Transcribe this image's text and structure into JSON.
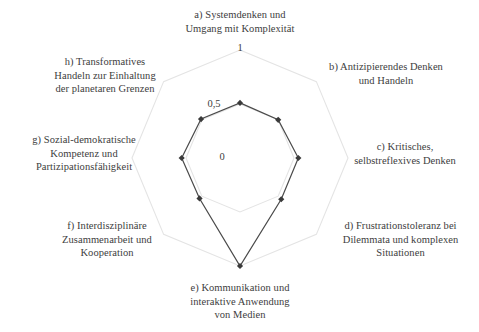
{
  "chart_data": {
    "type": "radar",
    "title": "",
    "categories": [
      "a) Systemdenken und Umgang mit Komplexität",
      "b) Antizipierendes Denken und Handeln",
      "c) Kritisches, selbstreflexives Denken",
      "d) Frustrationstoleranz bei Dilemmata und komplexen Situationen",
      "e) Kommunikation und interaktive Anwendung von Medien",
      "f) Interdisziplinäre Zusammenarbeit und Kooperation",
      "g) Sozial-demokratische Kompetenz und Partizipationsfähigkeit",
      "h) Transformatives Handeln zur Einhaltung der planetaren Grenzen"
    ],
    "short_labels": [
      "a",
      "b",
      "c",
      "d",
      "e",
      "f",
      "g",
      "h"
    ],
    "values": [
      0.51,
      0.5,
      0.54,
      0.54,
      1.0,
      0.53,
      0.54,
      0.51
    ],
    "rlim": [
      0,
      1
    ],
    "tick_values": [
      0,
      0.5,
      1
    ],
    "tick_labels": [
      "0",
      "0,5",
      "1"
    ],
    "grid": true,
    "legend": "none",
    "series": [
      {
        "name": "",
        "values": [
          0.51,
          0.5,
          0.54,
          0.54,
          1.0,
          0.53,
          0.54,
          0.51
        ]
      }
    ]
  },
  "colors": {
    "series_line": "#4a4a4a",
    "series_marker": "#3a3a3a",
    "grid": "#e4e4e4",
    "text": "#3d3d3d",
    "background": "#ffffff"
  },
  "axes": {
    "a": {
      "line1": "a) Systemdenken und",
      "line2": "Umgang mit Komplexität",
      "text": "a) Systemdenken und\nUmgang mit Komplexität"
    },
    "b": {
      "line1": "b) Antizipierendes Denken",
      "line2": "und Handeln",
      "text": "b) Antizipierendes Denken\nund Handeln"
    },
    "c": {
      "line1": "c) Kritisches,",
      "line2": "selbstreflexives Denken",
      "text": "c) Kritisches,\nselbstreflexives Denken"
    },
    "d": {
      "line1": "d) Frustrationstoleranz bei",
      "line2": "Dilemmata und komplexen",
      "line3": "Situationen",
      "text": "d) Frustrationstoleranz bei\nDilemmata und komplexen\nSituationen"
    },
    "e": {
      "line1": "e) Kommunikation und",
      "line2": "interaktive Anwendung",
      "line3": "von Medien",
      "text": "e) Kommunikation und\ninteraktive Anwendung\nvon Medien"
    },
    "f": {
      "line1": "f) Interdisziplinäre",
      "line2": "Zusammenarbeit und",
      "line3": "Kooperation",
      "text": "f) Interdisziplinäre\nZusammenarbeit und\nKooperation"
    },
    "g": {
      "line1": "g) Sozial-demokratische",
      "line2": "Kompetenz und",
      "line3": "Partizipationsfähigkeit",
      "text": "g) Sozial-demokratische\nKompetenz und\nPartizipationsfähigkeit"
    },
    "h": {
      "line1": "h) Transformatives",
      "line2": "Handeln zur Einhaltung",
      "line3": "der planetaren Grenzen",
      "text": "h) Transformatives\nHandeln zur Einhaltung\nder planetaren Grenzen"
    }
  },
  "ticks": {
    "outer": "1",
    "middle": "0,5",
    "center": "0"
  }
}
